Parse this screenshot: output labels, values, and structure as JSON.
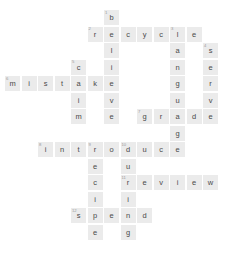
{
  "puzzle": {
    "type": "crossword",
    "title": "Crossword puzzle grid",
    "grid": {
      "columns": 13,
      "rows": 14,
      "cell_size_px": 15,
      "cell_pitch_px": 16.5,
      "origin_x_px": 5,
      "origin_y_px": 10,
      "cell_fill_color": "#ebebeb",
      "letter_color": "#4a4a4a",
      "clue_number_color": "#9a9a9a",
      "background_color": "#ffffff"
    },
    "answers_across": [
      {
        "number": "2",
        "text": "recycle",
        "row": 1,
        "col": 5
      },
      {
        "number": "6",
        "text": "mistake",
        "row": 4,
        "col": 0
      },
      {
        "number": "7",
        "text": "grade",
        "row": 6,
        "col": 8
      },
      {
        "number": "8",
        "text": "introduce",
        "row": 8,
        "col": 2
      },
      {
        "number": "11",
        "text": "review",
        "row": 10,
        "col": 7
      },
      {
        "number": "12",
        "text": "spend",
        "row": 12,
        "col": 4
      }
    ],
    "answers_down": [
      {
        "number": "1",
        "text": "believe",
        "row": 0,
        "col": 6
      },
      {
        "number": "3",
        "text": "language",
        "row": 1,
        "col": 10
      },
      {
        "number": "4",
        "text": "serve",
        "row": 2,
        "col": 12
      },
      {
        "number": "5",
        "text": "claim",
        "row": 3,
        "col": 4
      },
      {
        "number": "9",
        "text": "recipe",
        "row": 8,
        "col": 5
      },
      {
        "number": "10",
        "text": "during",
        "row": 8,
        "col": 7
      }
    ],
    "cells": [
      {
        "row": 0,
        "col": 6,
        "letter": "b",
        "num": "1"
      },
      {
        "row": 1,
        "col": 5,
        "letter": "r",
        "num": "2"
      },
      {
        "row": 1,
        "col": 6,
        "letter": "e",
        "num": ""
      },
      {
        "row": 1,
        "col": 7,
        "letter": "c",
        "num": ""
      },
      {
        "row": 1,
        "col": 8,
        "letter": "y",
        "num": ""
      },
      {
        "row": 1,
        "col": 9,
        "letter": "c",
        "num": ""
      },
      {
        "row": 1,
        "col": 10,
        "letter": "l",
        "num": "3"
      },
      {
        "row": 1,
        "col": 11,
        "letter": "e",
        "num": ""
      },
      {
        "row": 2,
        "col": 6,
        "letter": "l",
        "num": ""
      },
      {
        "row": 2,
        "col": 10,
        "letter": "a",
        "num": ""
      },
      {
        "row": 2,
        "col": 12,
        "letter": "s",
        "num": "4"
      },
      {
        "row": 3,
        "col": 4,
        "letter": "c",
        "num": "5"
      },
      {
        "row": 3,
        "col": 6,
        "letter": "i",
        "num": ""
      },
      {
        "row": 3,
        "col": 10,
        "letter": "n",
        "num": ""
      },
      {
        "row": 3,
        "col": 12,
        "letter": "e",
        "num": ""
      },
      {
        "row": 4,
        "col": 0,
        "letter": "m",
        "num": "6"
      },
      {
        "row": 4,
        "col": 1,
        "letter": "i",
        "num": ""
      },
      {
        "row": 4,
        "col": 2,
        "letter": "s",
        "num": ""
      },
      {
        "row": 4,
        "col": 3,
        "letter": "t",
        "num": ""
      },
      {
        "row": 4,
        "col": 4,
        "letter": "a",
        "num": ""
      },
      {
        "row": 4,
        "col": 5,
        "letter": "k",
        "num": ""
      },
      {
        "row": 4,
        "col": 6,
        "letter": "e",
        "num": ""
      },
      {
        "row": 4,
        "col": 10,
        "letter": "g",
        "num": ""
      },
      {
        "row": 4,
        "col": 12,
        "letter": "r",
        "num": ""
      },
      {
        "row": 5,
        "col": 4,
        "letter": "i",
        "num": ""
      },
      {
        "row": 5,
        "col": 6,
        "letter": "v",
        "num": ""
      },
      {
        "row": 5,
        "col": 10,
        "letter": "u",
        "num": ""
      },
      {
        "row": 5,
        "col": 12,
        "letter": "v",
        "num": ""
      },
      {
        "row": 6,
        "col": 4,
        "letter": "m",
        "num": ""
      },
      {
        "row": 6,
        "col": 6,
        "letter": "e",
        "num": ""
      },
      {
        "row": 6,
        "col": 8,
        "letter": "g",
        "num": "7"
      },
      {
        "row": 6,
        "col": 9,
        "letter": "r",
        "num": ""
      },
      {
        "row": 6,
        "col": 10,
        "letter": "a",
        "num": ""
      },
      {
        "row": 6,
        "col": 11,
        "letter": "d",
        "num": ""
      },
      {
        "row": 6,
        "col": 12,
        "letter": "e",
        "num": ""
      },
      {
        "row": 7,
        "col": 10,
        "letter": "g",
        "num": ""
      },
      {
        "row": 8,
        "col": 2,
        "letter": "i",
        "num": "8"
      },
      {
        "row": 8,
        "col": 3,
        "letter": "n",
        "num": ""
      },
      {
        "row": 8,
        "col": 4,
        "letter": "t",
        "num": ""
      },
      {
        "row": 8,
        "col": 5,
        "letter": "r",
        "num": "9"
      },
      {
        "row": 8,
        "col": 6,
        "letter": "o",
        "num": ""
      },
      {
        "row": 8,
        "col": 7,
        "letter": "d",
        "num": "10"
      },
      {
        "row": 8,
        "col": 8,
        "letter": "u",
        "num": ""
      },
      {
        "row": 8,
        "col": 9,
        "letter": "c",
        "num": ""
      },
      {
        "row": 8,
        "col": 10,
        "letter": "e",
        "num": ""
      },
      {
        "row": 9,
        "col": 5,
        "letter": "e",
        "num": ""
      },
      {
        "row": 9,
        "col": 7,
        "letter": "u",
        "num": ""
      },
      {
        "row": 10,
        "col": 5,
        "letter": "c",
        "num": ""
      },
      {
        "row": 10,
        "col": 7,
        "letter": "r",
        "num": "11"
      },
      {
        "row": 10,
        "col": 8,
        "letter": "e",
        "num": ""
      },
      {
        "row": 10,
        "col": 9,
        "letter": "v",
        "num": ""
      },
      {
        "row": 10,
        "col": 10,
        "letter": "i",
        "num": ""
      },
      {
        "row": 10,
        "col": 11,
        "letter": "e",
        "num": ""
      },
      {
        "row": 10,
        "col": 12,
        "letter": "w",
        "num": ""
      },
      {
        "row": 11,
        "col": 5,
        "letter": "i",
        "num": ""
      },
      {
        "row": 11,
        "col": 7,
        "letter": "i",
        "num": ""
      },
      {
        "row": 12,
        "col": 4,
        "letter": "s",
        "num": "12"
      },
      {
        "row": 12,
        "col": 5,
        "letter": "p",
        "num": ""
      },
      {
        "row": 12,
        "col": 6,
        "letter": "e",
        "num": ""
      },
      {
        "row": 12,
        "col": 7,
        "letter": "n",
        "num": ""
      },
      {
        "row": 12,
        "col": 8,
        "letter": "d",
        "num": ""
      },
      {
        "row": 13,
        "col": 5,
        "letter": "e",
        "num": ""
      },
      {
        "row": 13,
        "col": 7,
        "letter": "g",
        "num": ""
      }
    ]
  }
}
